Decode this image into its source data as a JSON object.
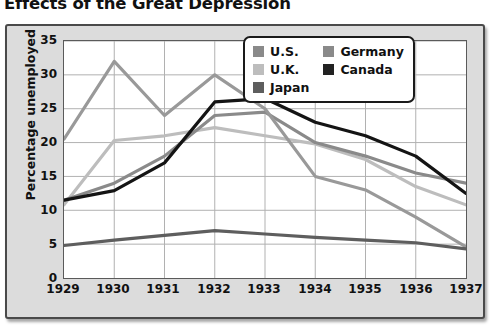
{
  "chart_data": {
    "type": "line",
    "title": "Effects of the Great Depression",
    "xlabel": "",
    "ylabel": "Percentage unemployed",
    "x": [
      "1929",
      "1930",
      "1931",
      "1932",
      "1933",
      "1934",
      "1935",
      "1936",
      "1937"
    ],
    "xlim": [
      1929,
      1937
    ],
    "ylim": [
      0,
      35
    ],
    "yticks": [
      "0",
      "5",
      "10",
      "15",
      "20",
      "25",
      "30",
      "35"
    ],
    "grid": true,
    "legend_position": "top-right",
    "series": [
      {
        "name": "U.S.",
        "color": "#8a8a8a",
        "values": [
          11.5,
          14.0,
          18.0,
          24.0,
          24.5,
          20.0,
          18.0,
          15.5,
          14.0
        ]
      },
      {
        "name": "U.K.",
        "color": "#bdbdbd",
        "values": [
          10.8,
          20.3,
          21.0,
          22.2,
          21.0,
          19.8,
          17.5,
          13.5,
          10.8
        ]
      },
      {
        "name": "Japan",
        "color": "#5e5e5e",
        "values": [
          4.8,
          5.6,
          6.3,
          7.0,
          6.5,
          6.0,
          5.6,
          5.2,
          4.3
        ]
      },
      {
        "name": "Germany",
        "color": "#999999",
        "values": [
          20.5,
          32.0,
          24.0,
          30.0,
          25.0,
          15.0,
          13.0,
          9.0,
          4.6
        ]
      },
      {
        "name": "Canada",
        "color": "#141414",
        "values": [
          11.5,
          12.9,
          17.0,
          26.0,
          26.5,
          23.0,
          21.0,
          18.0,
          12.5
        ]
      }
    ]
  },
  "legend": {
    "entries": [
      {
        "label": "U.S.",
        "swatch": "#8a8a8a"
      },
      {
        "label": "Germany",
        "swatch": "#8a8a8a"
      },
      {
        "label": "U.K.",
        "swatch": "#bdbdbd"
      },
      {
        "label": "Canada",
        "swatch": "#222222"
      },
      {
        "label": "Japan",
        "swatch": "#5e5e5e"
      }
    ]
  },
  "style": {
    "panel_bg": "#dcdcdc",
    "plot_bg": "#ffffff",
    "grid_color": "#b0b0b0",
    "axis_color": "#5a5a5a",
    "text_color": "#111111"
  }
}
